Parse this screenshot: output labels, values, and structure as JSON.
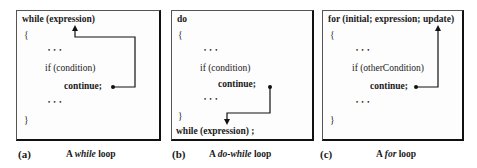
{
  "panels": [
    {
      "id": "a",
      "label": "(a)",
      "caption_prefix": "A ",
      "caption_italic": "while",
      "caption_suffix": " loop",
      "lines": {
        "header": "while (expression)",
        "open_brace": "{",
        "dots1": "• • •",
        "if": "if (condition)",
        "continue": "continue;",
        "dots2": "• • •",
        "close_brace": "}"
      }
    },
    {
      "id": "b",
      "label": "(b)",
      "caption_prefix": "A ",
      "caption_italic": "do-while",
      "caption_suffix": " loop",
      "lines": {
        "header": "do",
        "open_brace": "{",
        "dots1": "• • •",
        "if": "if (condition)",
        "continue": "continue;",
        "dots2": "• • •",
        "close_brace": "}",
        "footer": "while (expression) ;"
      }
    },
    {
      "id": "c",
      "label": "(c)",
      "caption_prefix": "A ",
      "caption_italic": "for",
      "caption_suffix": " loop",
      "lines": {
        "header": "for (initial; expression; update)",
        "open_brace": "{",
        "dots1": "• • •",
        "if": "if (otherCondition)",
        "continue": "continue;",
        "dots2": "• • •",
        "close_brace": "}"
      }
    }
  ],
  "colors": {
    "line": "#111111",
    "text": "#1a1a1a",
    "box_bg": "#fdfdfd"
  }
}
